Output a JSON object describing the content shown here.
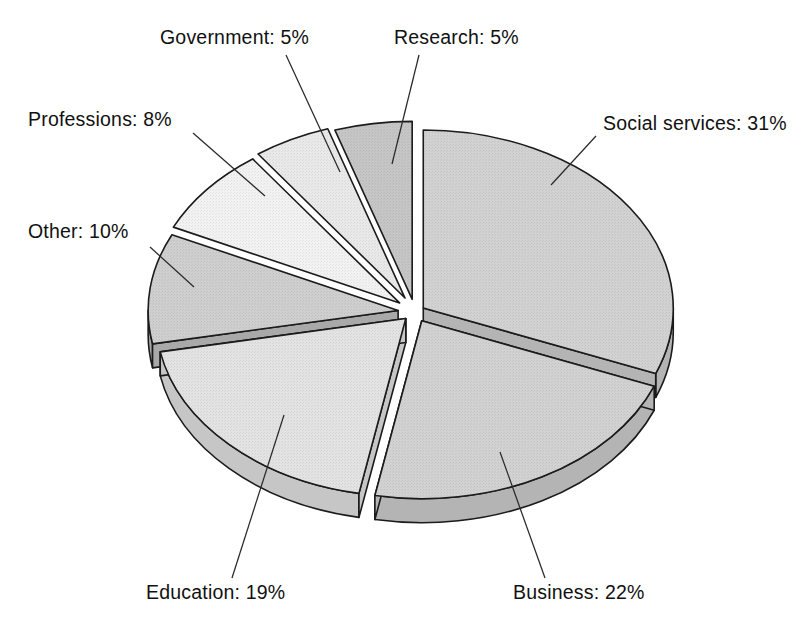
{
  "chart_data": {
    "type": "pie",
    "title": "",
    "subtitle": "",
    "xlabel": "",
    "ylabel": "",
    "legend_position": "none",
    "grid": false,
    "style": "3d-exploded-pie",
    "units": "percent",
    "total": 100,
    "categories": [
      "Social services",
      "Business",
      "Education",
      "Other",
      "Professions",
      "Government",
      "Research"
    ],
    "values": [
      31,
      22,
      19,
      10,
      8,
      5,
      5
    ],
    "labels": [
      "Social services:  31%",
      "Business:  22%",
      "Education: 19%",
      "Other:  10%",
      "Professions:  8%",
      "Government:  5%",
      "Research:  5%"
    ],
    "slices": [
      {
        "name": "Social services",
        "value": 31,
        "label": "Social services:  31%",
        "name_text": "Social services:",
        "value_text": "31%",
        "top_color": "#d2d2d2",
        "side_color": "#b4b4b4",
        "start_deg": 0,
        "end_deg": 111.6,
        "explode": 10
      },
      {
        "name": "Business",
        "value": 22,
        "label": "Business:  22%",
        "name_text": "Business:",
        "value_text": "22%",
        "top_color": "#d2d2d2",
        "side_color": "#b4b4b4",
        "start_deg": 111.6,
        "end_deg": 190.8,
        "explode": 14
      },
      {
        "name": "Education",
        "value": 19,
        "label": "Education: 19%",
        "name_text": "Education:",
        "value_text": "19%",
        "top_color": "#e3e3e3",
        "side_color": "#c6c6c6",
        "start_deg": 190.8,
        "end_deg": 259.2,
        "explode": 13
      },
      {
        "name": "Other",
        "value": 10,
        "label": "Other:  10%",
        "name_text": "Other:",
        "value_text": "10%",
        "top_color": "#cfcfcf",
        "side_color": "#a9a9a9",
        "start_deg": 259.2,
        "end_deg": 295.2,
        "explode": 17
      },
      {
        "name": "Professions",
        "value": 8,
        "label": "Professions:  8%",
        "name_text": "Professions:",
        "value_text": "8%",
        "top_color": "#f2f2f2",
        "side_color": "#d4d4d4",
        "start_deg": 295.2,
        "end_deg": 324.0,
        "explode": 20
      },
      {
        "name": "Government",
        "value": 5,
        "label": "Government:  5%",
        "name_text": "Government:",
        "value_text": "5%",
        "top_color": "#e9e9e9",
        "side_color": "#c3c3c3",
        "start_deg": 324.0,
        "end_deg": 342.0,
        "explode": 22
      },
      {
        "name": "Research",
        "value": 5,
        "label": "Research:  5%",
        "name_text": "Research:",
        "value_text": "5%",
        "top_color": "#c6c6c6",
        "side_color": "#9f9f9f",
        "start_deg": 342.0,
        "end_deg": 360.0,
        "explode": 18
      }
    ],
    "geometry": {
      "cx": 415,
      "cy": 312,
      "rx": 250,
      "ry": 178,
      "depth": 24
    },
    "annotations": [
      {
        "id": "social-services",
        "text": "Social services:  31%",
        "text_x": 603,
        "text_y": 130,
        "anchor": "start",
        "leader": "M 596 136 L 551 185"
      },
      {
        "id": "business",
        "text": "Business:  22%",
        "text_x": 513,
        "text_y": 599,
        "anchor": "start",
        "leader": "M 545 578 L 500 452"
      },
      {
        "id": "education",
        "text": "Education: 19%",
        "text_x": 146,
        "text_y": 599,
        "anchor": "start",
        "leader": "M 232 578 L 284 415"
      },
      {
        "id": "other",
        "text": "Other:  10%",
        "text_x": 28,
        "text_y": 238,
        "anchor": "start",
        "leader": "M 150 247 L 194 287"
      },
      {
        "id": "professions",
        "text": "Professions:  8%",
        "text_x": 28,
        "text_y": 126,
        "anchor": "start",
        "leader": "M 193 133 L 265 196"
      },
      {
        "id": "government",
        "text": "Government:  5%",
        "text_x": 160,
        "text_y": 44,
        "anchor": "start",
        "leader": "M 286 55 L 340 172"
      },
      {
        "id": "research",
        "text": "Research:  5%",
        "text_x": 394,
        "text_y": 44,
        "anchor": "start",
        "leader": "M 419 55 L 392 164"
      }
    ]
  }
}
